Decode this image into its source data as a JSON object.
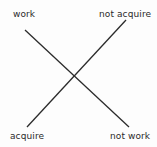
{
  "diagram": {
    "type": "crossed-lines",
    "labels": {
      "top_left": "work",
      "top_right": "not acquire",
      "bottom_left": "acquire",
      "bottom_right": "not work"
    },
    "lines": [
      {
        "from": "work",
        "to": "not work"
      },
      {
        "from": "acquire",
        "to": "not acquire"
      }
    ],
    "line_color": "#2b2b2b"
  }
}
